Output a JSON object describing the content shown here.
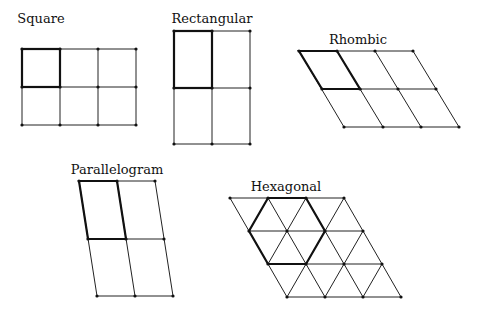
{
  "lattices": [
    {
      "name": "Square",
      "label_pos": [
        41,
        11
      ]
    },
    {
      "name": "Rectangular",
      "label_pos": [
        212,
        11
      ]
    },
    {
      "name": "Rhombic",
      "label_pos": [
        358,
        32
      ]
    },
    {
      "name": "Parallelogram",
      "label_pos": [
        117,
        162
      ]
    },
    {
      "name": "Hexagonal",
      "label_pos": [
        286,
        179
      ]
    }
  ],
  "colors": {
    "line": "#222222",
    "unit_cell": "#111111",
    "background": "#ffffff"
  }
}
